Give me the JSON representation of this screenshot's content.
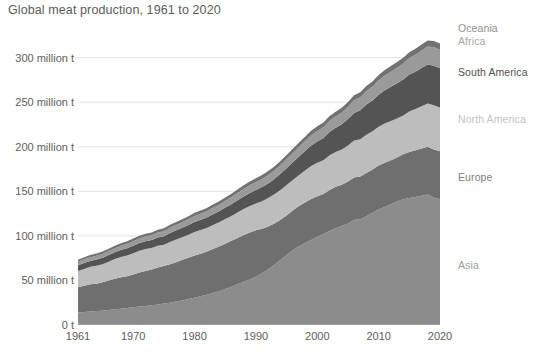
{
  "chart_data": {
    "type": "area",
    "title": "Global meat production, 1961 to 2020",
    "xlabel": "",
    "ylabel": "",
    "stacked": true,
    "grid": true,
    "legend_position": "right-inline",
    "xlim": [
      1961,
      2020
    ],
    "ylim": [
      0,
      340
    ],
    "y_unit": "million t",
    "x_ticks": [
      1961,
      1970,
      1980,
      1990,
      2000,
      2010,
      2020
    ],
    "x_tick_labels": [
      "1961",
      "1970",
      "1980",
      "1990",
      "2000",
      "2010",
      "2020"
    ],
    "y_ticks": [
      0,
      50,
      100,
      150,
      200,
      250,
      300
    ],
    "y_tick_labels": [
      "0 t",
      "50 million t",
      "100 million t",
      "150 million t",
      "200 million t",
      "250 million t",
      "300 million t"
    ],
    "x": [
      1961,
      1962,
      1963,
      1964,
      1965,
      1966,
      1967,
      1968,
      1969,
      1970,
      1971,
      1972,
      1973,
      1974,
      1975,
      1976,
      1977,
      1978,
      1979,
      1980,
      1981,
      1982,
      1983,
      1984,
      1985,
      1986,
      1987,
      1988,
      1989,
      1990,
      1991,
      1992,
      1993,
      1994,
      1995,
      1996,
      1997,
      1998,
      1999,
      2000,
      2001,
      2002,
      2003,
      2004,
      2005,
      2006,
      2007,
      2008,
      2009,
      2010,
      2011,
      2012,
      2013,
      2014,
      2015,
      2016,
      2017,
      2018,
      2019,
      2020
    ],
    "series": [
      {
        "name": "Asia",
        "color": "#8c8c8c",
        "values": [
          14.0,
          14.6,
          15.2,
          15.6,
          16.1,
          16.9,
          17.6,
          18.3,
          19.0,
          19.8,
          20.7,
          21.4,
          22.1,
          23.0,
          24.0,
          25.1,
          26.3,
          27.6,
          29.1,
          30.5,
          32.2,
          33.9,
          35.8,
          38.0,
          40.4,
          43.0,
          45.6,
          48.4,
          51.0,
          54.2,
          58.0,
          62.5,
          67.5,
          73.0,
          78.5,
          84.0,
          88.5,
          92.0,
          95.5,
          99.0,
          102.0,
          105.5,
          108.5,
          111.0,
          114.0,
          118.0,
          118.5,
          122.0,
          126.0,
          130.0,
          132.5,
          135.5,
          138.5,
          141.0,
          142.5,
          143.5,
          145.0,
          146.5,
          143.0,
          141.0
        ]
      },
      {
        "name": "Europe",
        "color": "#6f6f6f",
        "values": [
          28.5,
          29.5,
          30.5,
          30.8,
          31.8,
          33.0,
          34.2,
          35.2,
          35.8,
          37.0,
          38.2,
          39.2,
          40.2,
          41.5,
          42.2,
          43.0,
          44.2,
          45.5,
          46.5,
          47.5,
          47.8,
          48.5,
          49.5,
          50.0,
          50.8,
          51.5,
          52.0,
          52.5,
          52.8,
          52.0,
          50.0,
          48.0,
          46.5,
          45.0,
          44.5,
          44.5,
          45.0,
          45.5,
          46.0,
          45.5,
          45.0,
          46.0,
          46.5,
          46.5,
          47.0,
          47.5,
          48.0,
          48.5,
          48.5,
          49.0,
          49.5,
          49.5,
          49.5,
          50.5,
          51.5,
          52.5,
          53.0,
          53.5,
          54.0,
          54.0
        ]
      },
      {
        "name": "North America",
        "color": "#bdbdbd",
        "values": [
          18.0,
          18.8,
          19.6,
          20.2,
          20.3,
          21.2,
          22.2,
          22.8,
          23.1,
          23.8,
          24.5,
          24.6,
          24.0,
          24.3,
          23.8,
          25.0,
          25.5,
          25.3,
          25.6,
          26.3,
          26.5,
          26.4,
          27.0,
          27.3,
          27.8,
          27.8,
          28.6,
          29.2,
          29.6,
          30.2,
          31.0,
          32.0,
          32.6,
          33.6,
          34.0,
          34.2,
          34.6,
          36.0,
          37.0,
          37.5,
          37.8,
          39.0,
          39.0,
          39.5,
          40.5,
          41.5,
          42.0,
          43.0,
          42.8,
          43.5,
          44.0,
          43.8,
          43.8,
          43.5,
          45.5,
          46.5,
          47.5,
          48.5,
          49.5,
          49.0
        ]
      },
      {
        "name": "South America",
        "color": "#545454",
        "values": [
          6.5,
          6.7,
          6.6,
          6.9,
          7.2,
          7.4,
          7.6,
          7.8,
          8.2,
          8.4,
          8.5,
          8.8,
          9.0,
          9.3,
          9.6,
          10.0,
          10.3,
          10.6,
          11.0,
          11.4,
          11.6,
          11.8,
          12.0,
          12.3,
          12.8,
          13.2,
          13.7,
          14.2,
          14.8,
          15.2,
          15.8,
          16.4,
          17.2,
          18.0,
          19.0,
          19.8,
          20.8,
          21.8,
          23.0,
          24.0,
          25.0,
          26.2,
          27.2,
          28.2,
          29.6,
          31.0,
          32.5,
          34.0,
          34.5,
          36.0,
          37.5,
          38.5,
          39.5,
          40.5,
          41.5,
          41.8,
          43.0,
          43.8,
          44.5,
          44.0
        ]
      },
      {
        "name": "Africa",
        "color": "#9a9a9a",
        "values": [
          4.0,
          4.1,
          4.2,
          4.3,
          4.4,
          4.5,
          4.6,
          4.7,
          4.9,
          5.0,
          5.2,
          5.3,
          5.4,
          5.6,
          5.7,
          5.9,
          6.0,
          6.2,
          6.4,
          6.6,
          6.8,
          7.0,
          7.2,
          7.4,
          7.6,
          7.9,
          8.1,
          8.4,
          8.6,
          8.9,
          9.1,
          9.4,
          9.6,
          9.9,
          10.2,
          10.5,
          10.8,
          11.1,
          11.5,
          11.8,
          12.2,
          12.5,
          12.9,
          13.3,
          13.7,
          14.1,
          14.6,
          15.0,
          15.5,
          16.0,
          16.5,
          17.0,
          17.5,
          18.0,
          18.5,
          19.0,
          19.6,
          20.2,
          20.8,
          21.0
        ]
      },
      {
        "name": "Oceania",
        "color": "#727272",
        "values": [
          2.3,
          2.4,
          2.5,
          2.5,
          2.6,
          2.6,
          2.7,
          2.8,
          2.9,
          3.0,
          3.0,
          3.1,
          3.0,
          3.2,
          3.3,
          3.4,
          3.4,
          3.5,
          3.5,
          3.6,
          3.6,
          3.6,
          3.7,
          3.8,
          3.8,
          3.9,
          4.0,
          4.0,
          4.1,
          4.2,
          4.3,
          4.4,
          4.5,
          4.6,
          4.6,
          4.7,
          4.8,
          4.9,
          5.0,
          5.1,
          5.2,
          5.3,
          5.3,
          5.4,
          5.5,
          5.6,
          5.7,
          5.8,
          5.9,
          6.0,
          6.1,
          6.2,
          6.3,
          6.4,
          6.5,
          6.6,
          6.7,
          6.8,
          6.9,
          6.8
        ]
      }
    ],
    "legend": [
      {
        "label": "Oceania",
        "color": "#8f8f8f",
        "y": 28
      },
      {
        "label": "Africa",
        "color": "#a8a8a8",
        "y": 41
      },
      {
        "label": "South America",
        "color": "#4f4f4f",
        "y": 72
      },
      {
        "label": "North America",
        "color": "#c4c4c4",
        "y": 119
      },
      {
        "label": "Europe",
        "color": "#808080",
        "y": 177
      },
      {
        "label": "Asia",
        "color": "#9d9d9d",
        "y": 265
      }
    ]
  },
  "footnote": "",
  "colors": {
    "background": "#ffffff",
    "title": "#5b5b5b",
    "tick": "#5e5e5e",
    "grid": "#e4e4e4",
    "axis": "#b0b0b0"
  }
}
